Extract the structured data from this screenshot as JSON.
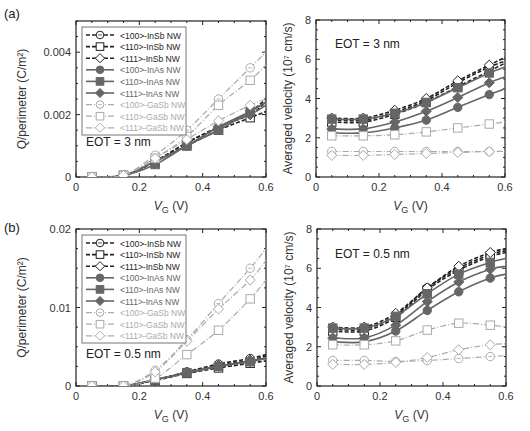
{
  "figure": {
    "panels": [
      {
        "label": "(a)"
      },
      {
        "label": "(b)"
      }
    ]
  },
  "legend": [
    {
      "text": "<100>-InSb NW",
      "group": "InSb",
      "marker": "circle-open"
    },
    {
      "text": "<110>-InSb NW",
      "group": "InSb",
      "marker": "square-open"
    },
    {
      "text": "<111>-InSb NW",
      "group": "InSb",
      "marker": "diamond-open"
    },
    {
      "text": "<100>-InAs NW",
      "group": "InAs",
      "marker": "circle-filled"
    },
    {
      "text": "<110>-InAs NW",
      "group": "InAs",
      "marker": "square-filled"
    },
    {
      "text": "<111>-InAs NW",
      "group": "InAs",
      "marker": "diamond-filled"
    },
    {
      "text": "<100>-GaSb NW",
      "group": "GaSb",
      "marker": "circle-open"
    },
    {
      "text": "<110>-GaSb NW",
      "group": "GaSb",
      "marker": "square-open"
    },
    {
      "text": "<111>-GaSb NW",
      "group": "GaSb",
      "marker": "diamond-open"
    }
  ],
  "styles": {
    "InSb": {
      "color": "#222222",
      "dash": "4,2",
      "width": 1.6
    },
    "InAs": {
      "color": "#666666",
      "dash": "",
      "width": 1.6
    },
    "GaSb": {
      "color": "#aaaaaa",
      "dash": "6,2,1,2",
      "width": 1.2
    }
  },
  "chart_data": [
    {
      "id": "a-charge",
      "type": "line",
      "panel": "(a)",
      "annotation": "EOT = 3 nm",
      "xlabel": "V_G (V)",
      "ylabel": "Q/perimeter (C/m²)",
      "xlim": [
        0,
        0.6
      ],
      "ylim": [
        0,
        0.005
      ],
      "xticks": [
        0,
        0.2,
        0.4,
        0.6
      ],
      "xtick_labels": [
        "0",
        "0.2",
        "0.4",
        "0.6"
      ],
      "yticks": [
        0,
        0.002,
        0.004
      ],
      "ytick_labels": [
        "0",
        "0.002",
        "0.004"
      ],
      "legend_position": "upper-left",
      "x": [
        0.05,
        0.15,
        0.25,
        0.35,
        0.45,
        0.55
      ],
      "series": [
        {
          "name": "<100>-InSb NW",
          "values": [
            0,
            5e-05,
            0.0005,
            0.0011,
            0.0016,
            0.0021
          ],
          "end": 0.0025
        },
        {
          "name": "<110>-InSb NW",
          "values": [
            0,
            5e-05,
            0.0005,
            0.001,
            0.0015,
            0.0019
          ],
          "end": 0.0021
        },
        {
          "name": "<111>-InSb NW",
          "values": [
            0,
            5e-05,
            0.0005,
            0.0011,
            0.0016,
            0.002
          ],
          "end": 0.0024
        },
        {
          "name": "<100>-InAs NW",
          "values": [
            0,
            5e-05,
            0.0005,
            0.001,
            0.0016,
            0.0021
          ],
          "end": 0.0024
        },
        {
          "name": "<110>-InAs NW",
          "values": [
            0,
            5e-05,
            0.0004,
            0.001,
            0.0015,
            0.0021
          ],
          "end": 0.0024
        },
        {
          "name": "<111>-InAs NW",
          "values": [
            0,
            5e-05,
            0.0005,
            0.001,
            0.0016,
            0.002
          ],
          "end": 0.0023
        },
        {
          "name": "<100>-GaSb NW",
          "values": [
            0,
            5e-05,
            0.0007,
            0.0015,
            0.0025,
            0.0035
          ],
          "end": 0.004
        },
        {
          "name": "<110>-GaSb NW",
          "values": [
            0,
            5e-05,
            0.0006,
            0.0013,
            0.0023,
            0.0031
          ],
          "end": 0.0036
        },
        {
          "name": "<111>-GaSb NW",
          "values": [
            0,
            5e-05,
            0.0006,
            0.0012,
            0.0018,
            0.0023
          ],
          "end": 0.0025
        }
      ]
    },
    {
      "id": "a-velocity",
      "type": "line",
      "panel": "(a)",
      "annotation": "EOT = 3 nm",
      "xlabel": "V_G (V)",
      "ylabel": "Averaged velocity (10⁷ cm/s)",
      "xlim": [
        0,
        0.6
      ],
      "ylim": [
        0,
        8
      ],
      "xticks": [
        0,
        0.2,
        0.4,
        0.6
      ],
      "xtick_labels": [
        "0",
        "0.2",
        "0.4",
        "0.6"
      ],
      "yticks": [
        0,
        2,
        4,
        6,
        8
      ],
      "ytick_labels": [
        "0",
        "2",
        "4",
        "6",
        "8"
      ],
      "x": [
        0.05,
        0.15,
        0.25,
        0.35,
        0.45,
        0.55
      ],
      "series": [
        {
          "name": "<100>-InSb NW",
          "values": [
            2.9,
            2.9,
            3.3,
            3.9,
            4.8,
            5.6
          ],
          "end": 5.9
        },
        {
          "name": "<110>-InSb NW",
          "values": [
            2.8,
            2.8,
            3.2,
            3.8,
            4.6,
            5.4
          ],
          "end": 5.8
        },
        {
          "name": "<111>-InSb NW",
          "values": [
            3.0,
            3.0,
            3.4,
            4.0,
            4.9,
            5.7
          ],
          "end": 6.1
        },
        {
          "name": "<100>-InAs NW",
          "values": [
            2.25,
            2.25,
            2.5,
            2.9,
            3.55,
            4.2
          ],
          "end": 4.5
        },
        {
          "name": "<110>-InAs NW",
          "values": [
            2.95,
            2.95,
            3.25,
            3.8,
            4.55,
            5.3
          ],
          "end": 5.6
        },
        {
          "name": "<111>-InAs NW",
          "values": [
            2.45,
            2.45,
            2.8,
            3.35,
            4.05,
            4.8
          ],
          "end": 5.1
        },
        {
          "name": "<100>-GaSb NW",
          "values": [
            1.3,
            1.3,
            1.3,
            1.3,
            1.3,
            1.3
          ],
          "end": 1.3
        },
        {
          "name": "<110>-GaSb NW",
          "values": [
            2.1,
            2.1,
            2.15,
            2.3,
            2.5,
            2.7
          ],
          "end": 2.8
        },
        {
          "name": "<111>-GaSb NW",
          "values": [
            1.1,
            1.1,
            1.15,
            1.2,
            1.25,
            1.3
          ],
          "end": 1.3
        }
      ]
    },
    {
      "id": "b-charge",
      "type": "line",
      "panel": "(b)",
      "annotation": "EOT = 0.5 nm",
      "xlabel": "V_G (V)",
      "ylabel": "Q/perimeter (C/m²)",
      "xlim": [
        0,
        0.6
      ],
      "ylim": [
        0,
        0.02
      ],
      "xticks": [
        0,
        0.2,
        0.4,
        0.6
      ],
      "xtick_labels": [
        "0",
        "0.2",
        "0.4",
        "0.6"
      ],
      "yticks": [
        0,
        0.01,
        0.02
      ],
      "ytick_labels": [
        "0",
        "0.01",
        "0.02"
      ],
      "legend_position": "upper-left",
      "x": [
        0.05,
        0.15,
        0.25,
        0.35,
        0.45,
        0.55
      ],
      "series": [
        {
          "name": "<100>-InSb NW",
          "values": [
            0,
            0,
            0.0008,
            0.0018,
            0.0028,
            0.0035
          ],
          "end": 0.004
        },
        {
          "name": "<110>-InSb NW",
          "values": [
            0,
            0,
            0.0007,
            0.0016,
            0.0023,
            0.0029
          ],
          "end": 0.0032
        },
        {
          "name": "<111>-InSb NW",
          "values": [
            0,
            0,
            0.0008,
            0.0017,
            0.0026,
            0.0033
          ],
          "end": 0.0038
        },
        {
          "name": "<100>-InAs NW",
          "values": [
            0,
            0,
            0.0008,
            0.0017,
            0.0025,
            0.0032
          ],
          "end": 0.0036
        },
        {
          "name": "<110>-InAs NW",
          "values": [
            0,
            0,
            0.0008,
            0.0017,
            0.0025,
            0.0031
          ],
          "end": 0.0035
        },
        {
          "name": "<111>-InAs NW",
          "values": [
            0,
            0,
            0.0008,
            0.0017,
            0.0025,
            0.0031
          ],
          "end": 0.0035
        },
        {
          "name": "<100>-GaSb NW",
          "values": [
            0,
            0,
            0.002,
            0.0059,
            0.0105,
            0.015
          ],
          "end": 0.0175
        },
        {
          "name": "<110>-GaSb NW",
          "values": [
            0,
            0,
            0.001,
            0.004,
            0.0071,
            0.0111
          ],
          "end": 0.0135
        },
        {
          "name": "<111>-GaSb NW",
          "values": [
            0,
            0,
            0.0018,
            0.0057,
            0.0098,
            0.0135
          ],
          "end": 0.016
        }
      ]
    },
    {
      "id": "b-velocity",
      "type": "line",
      "panel": "(b)",
      "annotation": "EOT = 0.5 nm",
      "xlabel": "V_G (V)",
      "ylabel": "Averaged velocity (10⁷ cm/s)",
      "xlim": [
        0,
        0.6
      ],
      "ylim": [
        0,
        8
      ],
      "xticks": [
        0,
        0.2,
        0.4,
        0.6
      ],
      "xtick_labels": [
        "0",
        "0.2",
        "0.4",
        "0.6"
      ],
      "yticks": [
        0,
        2,
        4,
        6,
        8
      ],
      "ytick_labels": [
        "0",
        "2",
        "4",
        "6",
        "8"
      ],
      "x": [
        0.05,
        0.15,
        0.25,
        0.35,
        0.45,
        0.55
      ],
      "series": [
        {
          "name": "<100>-InSb NW",
          "values": [
            2.9,
            2.9,
            3.6,
            5.0,
            6.0,
            6.7
          ],
          "end": 6.9
        },
        {
          "name": "<110>-InSb NW",
          "values": [
            2.8,
            2.8,
            3.5,
            4.9,
            5.9,
            6.6
          ],
          "end": 6.8
        },
        {
          "name": "<111>-InSb NW",
          "values": [
            3.0,
            3.0,
            3.7,
            5.0,
            6.1,
            6.8
          ],
          "end": 7.0
        },
        {
          "name": "<100>-InAs NW",
          "values": [
            2.25,
            2.25,
            2.8,
            3.85,
            4.8,
            5.5
          ],
          "end": 5.7
        },
        {
          "name": "<110>-InAs NW",
          "values": [
            2.95,
            2.95,
            3.55,
            4.7,
            5.7,
            6.3
          ],
          "end": 6.5
        },
        {
          "name": "<111>-InAs NW",
          "values": [
            2.45,
            2.45,
            3.1,
            4.3,
            5.3,
            5.95
          ],
          "end": 6.1
        },
        {
          "name": "<100>-GaSb NW",
          "values": [
            1.3,
            1.3,
            1.25,
            1.3,
            1.4,
            1.5
          ],
          "end": 1.55
        },
        {
          "name": "<110>-GaSb NW",
          "values": [
            2.1,
            2.1,
            2.3,
            2.85,
            3.2,
            3.1
          ],
          "end": 3.0
        },
        {
          "name": "<111>-GaSb NW",
          "values": [
            1.1,
            1.1,
            1.2,
            1.45,
            1.85,
            2.1
          ],
          "end": 2.15
        }
      ]
    }
  ]
}
